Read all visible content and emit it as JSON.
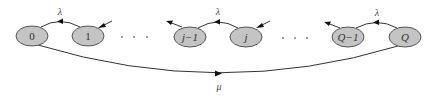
{
  "diagram": {
    "type": "state-transition",
    "nodes": [
      {
        "id": "n0",
        "label": "0",
        "cx": 32,
        "cy": 36,
        "italic": false
      },
      {
        "id": "n1",
        "label": "1",
        "cx": 88,
        "cy": 36,
        "italic": false
      },
      {
        "id": "nj1",
        "label": "j−1",
        "cx": 190,
        "cy": 37,
        "italic": true
      },
      {
        "id": "nj",
        "label": "j",
        "cx": 246,
        "cy": 37,
        "italic": true
      },
      {
        "id": "nQ1",
        "label": "Q−1",
        "cx": 348,
        "cy": 37,
        "italic": true
      },
      {
        "id": "nQ",
        "label": "Q",
        "cx": 405,
        "cy": 37,
        "italic": true
      }
    ],
    "edges": [
      {
        "from": "1",
        "to": "0",
        "label": "λ"
      },
      {
        "from": "j",
        "to": "j−1",
        "label": "λ"
      },
      {
        "from": "Q",
        "to": "Q−1",
        "label": "λ"
      },
      {
        "from": "0",
        "to": "Q",
        "label": "μ"
      }
    ],
    "labels": {
      "lambda_1": "λ",
      "lambda_2": "λ",
      "lambda_3": "λ",
      "mu": "μ"
    },
    "ellipsis": [
      "· · ·",
      "· · ·"
    ]
  }
}
